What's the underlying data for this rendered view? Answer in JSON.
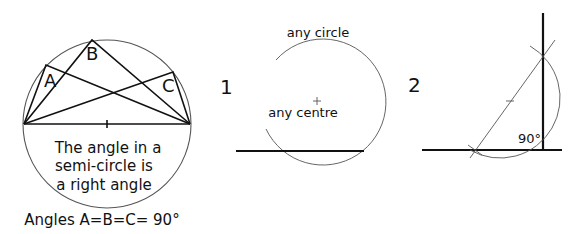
{
  "figure_main": {
    "vertex_labels": {
      "a": "A",
      "b": "B",
      "c": "C"
    },
    "caption_lines": [
      "The angle in a",
      "semi-circle is",
      "a right angle"
    ],
    "footer": "Angles A=B=C= 90°"
  },
  "figure_1": {
    "number": "1",
    "circle_label": "any circle",
    "centre_label": "any centre"
  },
  "figure_2": {
    "number": "2",
    "angle_label": "90°"
  },
  "colors": {
    "ink": "#111111",
    "construction": "#555555",
    "background": "#ffffff"
  }
}
